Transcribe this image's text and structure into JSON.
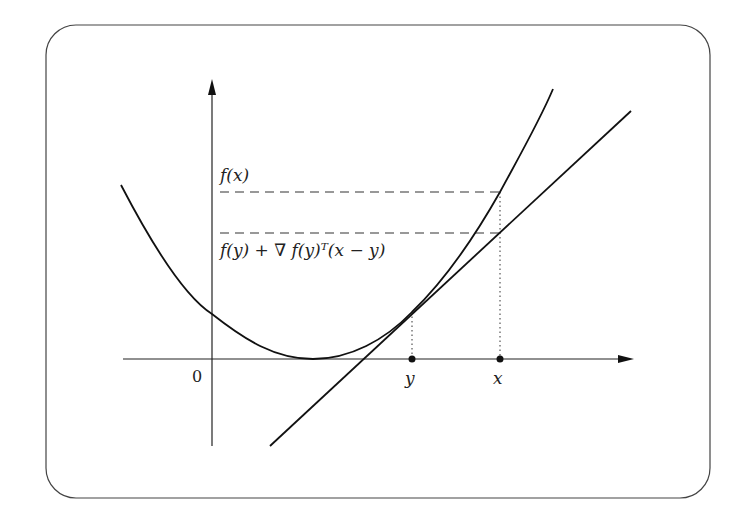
{
  "figure": {
    "labels": {
      "fx": "f(x)",
      "tangent": "f(y) + ∇ f(y)ᵀ(x − y)",
      "origin": "0",
      "y_point": "y",
      "x_point": "x"
    },
    "colors": {
      "stroke": "#111111",
      "frame": "#444444",
      "background": "#ffffff"
    },
    "elements": {
      "function_curve": "f (convex)",
      "tangent_line": "first-order approximation at y",
      "dashed_levels": [
        "f(x)",
        "f(y) + ∇f(y)ᵀ(x − y)"
      ],
      "points": [
        "y",
        "x"
      ]
    }
  }
}
